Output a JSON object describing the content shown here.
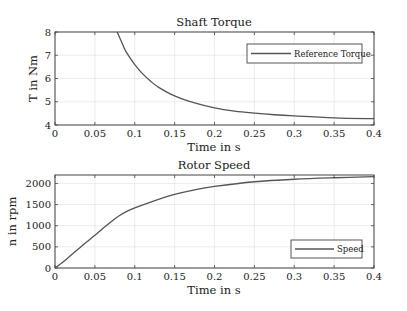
{
  "chart_data": [
    {
      "type": "line",
      "title": "Shaft Torque",
      "xlabel": "Time in s",
      "ylabel": "T in Nm",
      "xlim": [
        0,
        0.4
      ],
      "ylim": [
        4,
        8
      ],
      "xticks": [
        0,
        0.05,
        0.1,
        0.15,
        0.2,
        0.25,
        0.3,
        0.35,
        0.4
      ],
      "xtick_labels": [
        "0",
        "0.05",
        "0.1",
        "0.15",
        "0.2",
        "0.25",
        "0.3",
        "0.35",
        "0.4"
      ],
      "yticks": [
        4,
        5,
        6,
        7,
        8
      ],
      "ytick_labels": [
        "4",
        "5",
        "6",
        "7",
        "8"
      ],
      "grid": true,
      "legend_position": "top-right",
      "series": [
        {
          "name": "Reference Torque",
          "color": "#555555",
          "x": [
            0.078,
            0.085,
            0.09,
            0.1,
            0.11,
            0.12,
            0.13,
            0.15,
            0.175,
            0.2,
            0.225,
            0.25,
            0.275,
            0.3,
            0.35,
            0.4
          ],
          "y": [
            8.0,
            7.45,
            7.1,
            6.6,
            6.2,
            5.88,
            5.62,
            5.25,
            4.95,
            4.74,
            4.6,
            4.51,
            4.44,
            4.39,
            4.31,
            4.27
          ]
        }
      ]
    },
    {
      "type": "line",
      "title": "Rotor Speed",
      "xlabel": "Time in s",
      "ylabel": "n in rpm",
      "xlim": [
        0,
        0.4
      ],
      "ylim": [
        0,
        2200
      ],
      "xticks": [
        0,
        0.05,
        0.1,
        0.15,
        0.2,
        0.25,
        0.3,
        0.35,
        0.4
      ],
      "xtick_labels": [
        "0",
        "0.05",
        "0.1",
        "0.15",
        "0.2",
        "0.25",
        "0.3",
        "0.35",
        "0.4"
      ],
      "yticks": [
        0,
        500,
        1000,
        1500,
        2000
      ],
      "ytick_labels": [
        "0",
        "500",
        "1000",
        "1500",
        "2000"
      ],
      "grid": true,
      "legend_position": "bottom-right",
      "series": [
        {
          "name": "Speed",
          "color": "#555555",
          "x": [
            0,
            0.01,
            0.02,
            0.03,
            0.04,
            0.05,
            0.06,
            0.07,
            0.08,
            0.09,
            0.1,
            0.12,
            0.15,
            0.175,
            0.2,
            0.25,
            0.3,
            0.35,
            0.4
          ],
          "y": [
            0,
            140,
            300,
            460,
            620,
            775,
            935,
            1090,
            1230,
            1340,
            1420,
            1560,
            1740,
            1850,
            1930,
            2040,
            2100,
            2135,
            2160
          ]
        }
      ]
    }
  ]
}
